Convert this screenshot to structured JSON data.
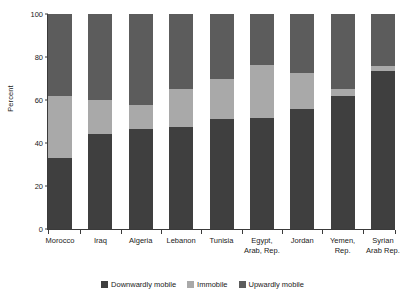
{
  "chart_data": {
    "type": "bar",
    "stacked": true,
    "title": "",
    "xlabel": "",
    "ylabel": "Percent",
    "ylim": [
      0,
      100
    ],
    "yticks": [
      0,
      20,
      40,
      60,
      80,
      100
    ],
    "grid": false,
    "legend_position": "bottom",
    "categories": [
      "Morocco",
      "Iraq",
      "Algeria",
      "Lebanon",
      "Tunisia",
      "Egypt, Arab, Rep.",
      "Jordan",
      "Yemen, Rep.",
      "Syrian Arab Rep."
    ],
    "category_lines": [
      [
        "Morocco"
      ],
      [
        "Iraq"
      ],
      [
        "Algeria"
      ],
      [
        "Lebanon"
      ],
      [
        "Tunisia"
      ],
      [
        "Egypt,",
        "Arab, Rep."
      ],
      [
        "Jordan"
      ],
      [
        "Yemen,",
        "Rep."
      ],
      [
        "Syrian",
        "Arab Rep."
      ]
    ],
    "series": [
      {
        "name": "Downwardly mobile",
        "color": "#3f3f3f",
        "values": [
          33,
          44,
          46.5,
          47.5,
          51,
          51.5,
          56,
          62,
          73.5
        ]
      },
      {
        "name": "Immobile",
        "color": "#a9a9a9",
        "values": [
          29,
          16,
          11,
          17.5,
          19,
          25,
          16.5,
          3,
          2.5
        ]
      },
      {
        "name": "Upwardly mobile",
        "color": "#5c5c5c",
        "values": [
          38,
          40,
          42.5,
          35,
          30,
          23.5,
          27.5,
          35,
          24
        ]
      }
    ]
  },
  "legend": {
    "items": [
      {
        "label": "Downwardly mobile",
        "color": "#3f3f3f"
      },
      {
        "label": "Immobile",
        "color": "#a9a9a9"
      },
      {
        "label": "Upwardly mobile",
        "color": "#5c5c5c"
      }
    ]
  }
}
